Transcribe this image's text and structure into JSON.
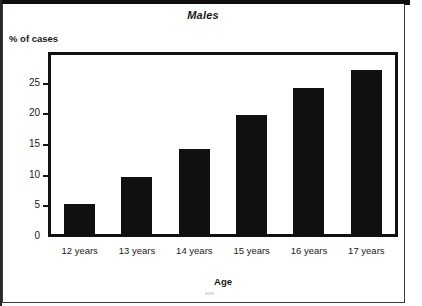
{
  "chart_data": {
    "type": "bar",
    "title": "Males",
    "xlabel": "Age",
    "ylabel": "% of cases",
    "categories": [
      "12 years",
      "13 years",
      "14 years",
      "15 years",
      "16 years",
      "17 years"
    ],
    "values": [
      5.2,
      9.6,
      14.2,
      19.8,
      24.2,
      27.1
    ],
    "ytick_labels": [
      "0",
      "5",
      "10",
      "15",
      "20",
      "25"
    ],
    "ytick_values": [
      0,
      5,
      10,
      15,
      20,
      25
    ],
    "ylim": [
      0,
      29.5
    ],
    "grid": false,
    "legend": false,
    "bar_color": "#111010",
    "frame_color": "#121110",
    "text_color": "#1b1a18"
  },
  "figure": {
    "title": "Males",
    "y_axis_title": "% of cases",
    "x_axis_title": "Age"
  }
}
